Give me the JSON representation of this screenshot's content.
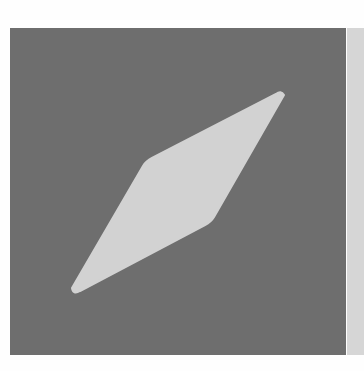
{
  "canvas": {
    "width": 364,
    "height": 371,
    "background": "#fefefe"
  },
  "tile": {
    "color": "#6e6e6e",
    "x": 10,
    "y": 28,
    "width": 336,
    "height": 327
  },
  "side_panel": {
    "color": "#d6d6d6",
    "x": 347,
    "y": 28,
    "width": 17,
    "height": 327
  },
  "icon": {
    "name": "compass-needle-icon",
    "fill": "#d2d2d2",
    "points": [
      [
        281,
        92
      ],
      [
        148,
        160
      ],
      [
        75,
        292
      ],
      [
        210,
        222
      ]
    ]
  }
}
